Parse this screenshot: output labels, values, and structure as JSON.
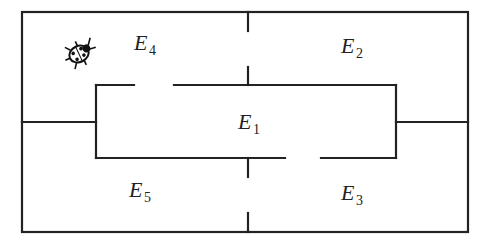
{
  "diagram": {
    "rooms": [
      {
        "id": "E1",
        "letter": "E",
        "sub": "1"
      },
      {
        "id": "E2",
        "letter": "E",
        "sub": "2"
      },
      {
        "id": "E3",
        "letter": "E",
        "sub": "3"
      },
      {
        "id": "E4",
        "letter": "E",
        "sub": "4"
      },
      {
        "id": "E5",
        "letter": "E",
        "sub": "5"
      }
    ],
    "creature": {
      "icon": "ladybug-icon",
      "location": "E4"
    },
    "openings": [
      "E4-E2 (top divider)",
      "E4-E1 (inner top gap)",
      "E1-E3 (inner bottom gap)",
      "E5-E3 (bottom divider)"
    ],
    "colors": {
      "wall": "#222222",
      "background": "#ffffff"
    }
  }
}
